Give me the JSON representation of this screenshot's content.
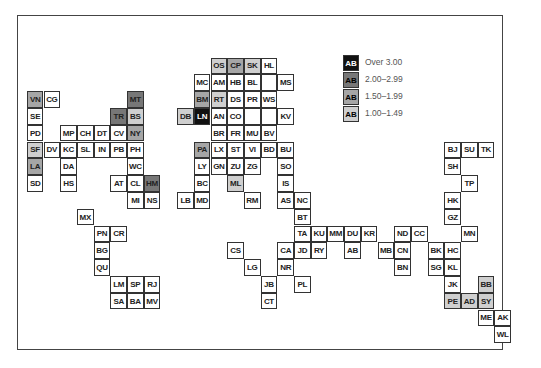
{
  "legend": {
    "sample_code": "AB",
    "items": [
      {
        "label": "Over 3.00",
        "level": 4,
        "color": "#111111"
      },
      {
        "label": "2.00–2.99",
        "level": 3,
        "color": "#777777"
      },
      {
        "label": "1.50–1.99",
        "level": 2,
        "color": "#a6a6a6"
      },
      {
        "label": "1.00–1.49",
        "level": 1,
        "color": "#cfcfcf"
      }
    ]
  },
  "grid": {
    "origin_x": 27.3,
    "origin_y": 58,
    "cell_w": 16.7,
    "cell_h": 16.8
  },
  "cells": [
    {
      "code": "OS",
      "row": 0,
      "col": 11,
      "level": 1
    },
    {
      "code": "CP",
      "row": 0,
      "col": 12,
      "level": 2
    },
    {
      "code": "SK",
      "row": 0,
      "col": 13,
      "level": 1
    },
    {
      "code": "HL",
      "row": 0,
      "col": 14,
      "level": 0
    },
    {
      "code": "MC",
      "row": 1,
      "col": 10,
      "level": 0
    },
    {
      "code": "AM",
      "row": 1,
      "col": 11,
      "level": 0
    },
    {
      "code": "HB",
      "row": 1,
      "col": 12,
      "level": 0
    },
    {
      "code": "BL",
      "row": 1,
      "col": 13,
      "level": 0
    },
    {
      "code": "",
      "row": 1,
      "col": 14,
      "level": 0
    },
    {
      "code": "MS",
      "row": 1,
      "col": 15,
      "level": 0
    },
    {
      "code": "VN",
      "row": 2,
      "col": 0,
      "level": 2
    },
    {
      "code": "CG",
      "row": 2,
      "col": 1,
      "level": 0
    },
    {
      "code": "MT",
      "row": 2,
      "col": 6,
      "level": 3
    },
    {
      "code": "BM",
      "row": 2,
      "col": 10,
      "level": 2
    },
    {
      "code": "RT",
      "row": 2,
      "col": 11,
      "level": 1
    },
    {
      "code": "DS",
      "row": 2,
      "col": 12,
      "level": 0
    },
    {
      "code": "PR",
      "row": 2,
      "col": 13,
      "level": 0
    },
    {
      "code": "WS",
      "row": 2,
      "col": 14,
      "level": 0
    },
    {
      "code": "SE",
      "row": 3,
      "col": 0,
      "level": 0
    },
    {
      "code": "TR",
      "row": 3,
      "col": 5,
      "level": 3
    },
    {
      "code": "BS",
      "row": 3,
      "col": 6,
      "level": 1
    },
    {
      "code": "DB",
      "row": 3,
      "col": 9,
      "level": 1
    },
    {
      "code": "LN",
      "row": 3,
      "col": 10,
      "level": 4
    },
    {
      "code": "AN",
      "row": 3,
      "col": 11,
      "level": 0
    },
    {
      "code": "CO",
      "row": 3,
      "col": 12,
      "level": 0
    },
    {
      "code": "",
      "row": 3,
      "col": 13,
      "level": 0
    },
    {
      "code": "",
      "row": 3,
      "col": 14,
      "level": 0
    },
    {
      "code": "KV",
      "row": 3,
      "col": 15,
      "level": 0
    },
    {
      "code": "PD",
      "row": 4,
      "col": 0,
      "level": 0
    },
    {
      "code": "MP",
      "row": 4,
      "col": 2,
      "level": 0
    },
    {
      "code": "CH",
      "row": 4,
      "col": 3,
      "level": 0
    },
    {
      "code": "DT",
      "row": 4,
      "col": 4,
      "level": 0
    },
    {
      "code": "CV",
      "row": 4,
      "col": 5,
      "level": 0
    },
    {
      "code": "NY",
      "row": 4,
      "col": 6,
      "level": 2
    },
    {
      "code": "BR",
      "row": 4,
      "col": 11,
      "level": 0
    },
    {
      "code": "FR",
      "row": 4,
      "col": 12,
      "level": 0
    },
    {
      "code": "MU",
      "row": 4,
      "col": 13,
      "level": 0
    },
    {
      "code": "BV",
      "row": 4,
      "col": 14,
      "level": 0
    },
    {
      "code": "SF",
      "row": 5,
      "col": 0,
      "level": 1
    },
    {
      "code": "DV",
      "row": 5,
      "col": 1,
      "level": 0
    },
    {
      "code": "KC",
      "row": 5,
      "col": 2,
      "level": 0
    },
    {
      "code": "SL",
      "row": 5,
      "col": 3,
      "level": 0
    },
    {
      "code": "IN",
      "row": 5,
      "col": 4,
      "level": 0
    },
    {
      "code": "PB",
      "row": 5,
      "col": 5,
      "level": 0
    },
    {
      "code": "PH",
      "row": 5,
      "col": 6,
      "level": 0
    },
    {
      "code": "PA",
      "row": 5,
      "col": 10,
      "level": 2
    },
    {
      "code": "LX",
      "row": 5,
      "col": 11,
      "level": 0
    },
    {
      "code": "ST",
      "row": 5,
      "col": 12,
      "level": 0
    },
    {
      "code": "VI",
      "row": 5,
      "col": 13,
      "level": 0
    },
    {
      "code": "BD",
      "row": 5,
      "col": 14,
      "level": 0
    },
    {
      "code": "BU",
      "row": 5,
      "col": 15,
      "level": 0
    },
    {
      "code": "BJ",
      "row": 5,
      "col": 25,
      "level": 0
    },
    {
      "code": "SU",
      "row": 5,
      "col": 26,
      "level": 0
    },
    {
      "code": "TK",
      "row": 5,
      "col": 27,
      "level": 0
    },
    {
      "code": "LA",
      "row": 6,
      "col": 0,
      "level": 2
    },
    {
      "code": "DA",
      "row": 6,
      "col": 2,
      "level": 0
    },
    {
      "code": "WC",
      "row": 6,
      "col": 6,
      "level": 0
    },
    {
      "code": "LY",
      "row": 6,
      "col": 10,
      "level": 0
    },
    {
      "code": "GN",
      "row": 6,
      "col": 11,
      "level": 0
    },
    {
      "code": "ZU",
      "row": 6,
      "col": 12,
      "level": 0
    },
    {
      "code": "ZG",
      "row": 6,
      "col": 13,
      "level": 0
    },
    {
      "code": "SO",
      "row": 6,
      "col": 15,
      "level": 0
    },
    {
      "code": "SH",
      "row": 6,
      "col": 25,
      "level": 0
    },
    {
      "code": "SD",
      "row": 7,
      "col": 0,
      "level": 0
    },
    {
      "code": "HS",
      "row": 7,
      "col": 2,
      "level": 0
    },
    {
      "code": "AT",
      "row": 7,
      "col": 5,
      "level": 0
    },
    {
      "code": "CL",
      "row": 7,
      "col": 6,
      "level": 0
    },
    {
      "code": "HM",
      "row": 7,
      "col": 7,
      "level": 3
    },
    {
      "code": "BC",
      "row": 7,
      "col": 10,
      "level": 0
    },
    {
      "code": "ML",
      "row": 7,
      "col": 12,
      "level": 1
    },
    {
      "code": "IS",
      "row": 7,
      "col": 15,
      "level": 0
    },
    {
      "code": "TP",
      "row": 7,
      "col": 26,
      "level": 0
    },
    {
      "code": "MI",
      "row": 8,
      "col": 6,
      "level": 0
    },
    {
      "code": "NS",
      "row": 8,
      "col": 7,
      "level": 0
    },
    {
      "code": "LB",
      "row": 8,
      "col": 9,
      "level": 0
    },
    {
      "code": "MD",
      "row": 8,
      "col": 10,
      "level": 0
    },
    {
      "code": "RM",
      "row": 8,
      "col": 13,
      "level": 0
    },
    {
      "code": "AS",
      "row": 8,
      "col": 15,
      "level": 0
    },
    {
      "code": "NC",
      "row": 8,
      "col": 16,
      "level": 0
    },
    {
      "code": "HK",
      "row": 8,
      "col": 25,
      "level": 0
    },
    {
      "code": "MX",
      "row": 9,
      "col": 3,
      "level": 0
    },
    {
      "code": "BT",
      "row": 9,
      "col": 16,
      "level": 0
    },
    {
      "code": "GZ",
      "row": 9,
      "col": 25,
      "level": 0
    },
    {
      "code": "PN",
      "row": 10,
      "col": 4,
      "level": 0
    },
    {
      "code": "CR",
      "row": 10,
      "col": 5,
      "level": 0
    },
    {
      "code": "TA",
      "row": 10,
      "col": 16,
      "level": 0
    },
    {
      "code": "KU",
      "row": 10,
      "col": 17,
      "level": 0
    },
    {
      "code": "MM",
      "row": 10,
      "col": 18,
      "level": 0
    },
    {
      "code": "DU",
      "row": 10,
      "col": 19,
      "level": 0
    },
    {
      "code": "KR",
      "row": 10,
      "col": 20,
      "level": 0
    },
    {
      "code": "ND",
      "row": 10,
      "col": 22,
      "level": 0
    },
    {
      "code": "CC",
      "row": 10,
      "col": 23,
      "level": 0
    },
    {
      "code": "MN",
      "row": 10,
      "col": 26,
      "level": 0
    },
    {
      "code": "BG",
      "row": 11,
      "col": 4,
      "level": 0
    },
    {
      "code": "CS",
      "row": 11,
      "col": 12,
      "level": 0
    },
    {
      "code": "CA",
      "row": 11,
      "col": 15,
      "level": 0
    },
    {
      "code": "JD",
      "row": 11,
      "col": 16,
      "level": 0
    },
    {
      "code": "RY",
      "row": 11,
      "col": 17,
      "level": 0
    },
    {
      "code": "AB",
      "row": 11,
      "col": 19,
      "level": 0
    },
    {
      "code": "MB",
      "row": 11,
      "col": 21,
      "level": 0
    },
    {
      "code": "CN",
      "row": 11,
      "col": 22,
      "level": 0
    },
    {
      "code": "BK",
      "row": 11,
      "col": 24,
      "level": 0
    },
    {
      "code": "HC",
      "row": 11,
      "col": 25,
      "level": 0
    },
    {
      "code": "QU",
      "row": 12,
      "col": 4,
      "level": 0
    },
    {
      "code": "LG",
      "row": 12,
      "col": 13,
      "level": 0
    },
    {
      "code": "NR",
      "row": 12,
      "col": 15,
      "level": 0
    },
    {
      "code": "BN",
      "row": 12,
      "col": 22,
      "level": 0
    },
    {
      "code": "SG",
      "row": 12,
      "col": 24,
      "level": 0
    },
    {
      "code": "KL",
      "row": 12,
      "col": 25,
      "level": 0
    },
    {
      "code": "LM",
      "row": 13,
      "col": 5,
      "level": 0
    },
    {
      "code": "SP",
      "row": 13,
      "col": 6,
      "level": 0
    },
    {
      "code": "RJ",
      "row": 13,
      "col": 7,
      "level": 0
    },
    {
      "code": "JB",
      "row": 13,
      "col": 14,
      "level": 0
    },
    {
      "code": "PL",
      "row": 13,
      "col": 16,
      "level": 0
    },
    {
      "code": "JK",
      "row": 13,
      "col": 25,
      "level": 0
    },
    {
      "code": "BB",
      "row": 13,
      "col": 27,
      "level": 1
    },
    {
      "code": "SA",
      "row": 14,
      "col": 5,
      "level": 0
    },
    {
      "code": "BA",
      "row": 14,
      "col": 6,
      "level": 0
    },
    {
      "code": "MV",
      "row": 14,
      "col": 7,
      "level": 0
    },
    {
      "code": "CT",
      "row": 14,
      "col": 14,
      "level": 0
    },
    {
      "code": "PE",
      "row": 14,
      "col": 25,
      "level": 1
    },
    {
      "code": "AD",
      "row": 14,
      "col": 26,
      "level": 1
    },
    {
      "code": "SY",
      "row": 14,
      "col": 27,
      "level": 1
    },
    {
      "code": "ME",
      "row": 15,
      "col": 27,
      "level": 0
    },
    {
      "code": "AK",
      "row": 15,
      "col": 28,
      "level": 0
    },
    {
      "code": "WL",
      "row": 16,
      "col": 28,
      "level": 0
    }
  ]
}
